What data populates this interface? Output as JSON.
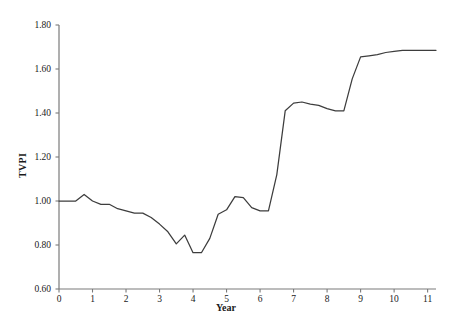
{
  "chart_data": {
    "type": "line",
    "title": "",
    "xlabel": "Year",
    "ylabel": "TVPI",
    "xlim": [
      0,
      11.25
    ],
    "ylim": [
      0.6,
      1.8
    ],
    "xticks": [
      0,
      1,
      2,
      3,
      4,
      5,
      6,
      7,
      8,
      9,
      10,
      11
    ],
    "xtick_labels": [
      "0",
      "1",
      "2",
      "3",
      "4",
      "5",
      "6",
      "7",
      "8",
      "9",
      "10",
      "11"
    ],
    "yticks": [
      0.6,
      0.8,
      1.0,
      1.2,
      1.4,
      1.6,
      1.8
    ],
    "ytick_labels": [
      "0.60",
      "0.80",
      "1.00",
      "1.20",
      "1.40",
      "1.60",
      "1.80"
    ],
    "grid": false,
    "legend": false,
    "line_color": "#3d3d3d",
    "axis_color": "#7a7a7a",
    "background": "#ffffff",
    "series": [
      {
        "name": "TVPI",
        "x": [
          0,
          0.25,
          0.5,
          0.75,
          1.0,
          1.25,
          1.5,
          1.75,
          2.0,
          2.25,
          2.5,
          2.75,
          3.0,
          3.25,
          3.5,
          3.75,
          4.0,
          4.25,
          4.5,
          4.75,
          5.0,
          5.25,
          5.5,
          5.75,
          6.0,
          6.25,
          6.5,
          6.75,
          7.0,
          7.25,
          7.5,
          7.75,
          8.0,
          8.25,
          8.5,
          8.75,
          9.0,
          9.25,
          9.5,
          9.75,
          10.0,
          10.25,
          10.5,
          10.75,
          11.0,
          11.25
        ],
        "y": [
          1.0,
          1.0,
          1.0,
          1.03,
          1.0,
          0.985,
          0.985,
          0.965,
          0.955,
          0.945,
          0.945,
          0.925,
          0.895,
          0.86,
          0.805,
          0.845,
          0.765,
          0.765,
          0.83,
          0.94,
          0.96,
          1.02,
          1.015,
          0.97,
          0.955,
          0.955,
          1.12,
          1.41,
          1.445,
          1.45,
          1.44,
          1.435,
          1.42,
          1.41,
          1.41,
          1.555,
          1.655,
          1.66,
          1.665,
          1.675,
          1.68,
          1.685,
          1.685,
          1.685,
          1.685,
          1.685
        ]
      }
    ]
  },
  "axes": {
    "y_title": "TVPI",
    "x_title": "Year"
  }
}
